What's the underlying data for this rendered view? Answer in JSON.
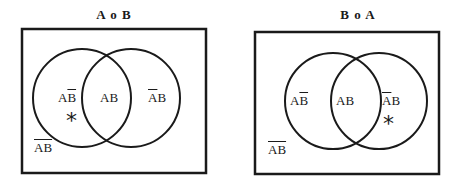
{
  "diagrams": [
    {
      "title": "A o B",
      "regions": {
        "a_only": {
          "base": "A",
          "overlined": "B"
        },
        "both": "AB",
        "b_only": {
          "overlined": "A",
          "base": "B"
        },
        "neither": {
          "overlined": "AB"
        }
      },
      "marker": {
        "symbol": "*",
        "region": "a_only"
      }
    },
    {
      "title": "B o A",
      "regions": {
        "a_only": {
          "base": "A",
          "overlined": "B"
        },
        "both": "AB",
        "b_only": {
          "overlined": "A",
          "base": "B"
        },
        "neither": {
          "overlined": "AB"
        }
      },
      "marker": {
        "symbol": "*",
        "region": "b_only"
      }
    }
  ],
  "colors": {
    "stroke": "#1a1a1a",
    "background": "#ffffff"
  }
}
